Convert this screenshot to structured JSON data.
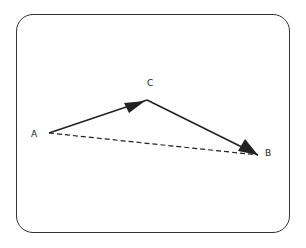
{
  "diagram": {
    "type": "vector-triangle",
    "points": {
      "A": {
        "label": "A",
        "x": 49,
        "y": 133
      },
      "C": {
        "label": "C",
        "x": 147,
        "y": 100
      },
      "B": {
        "label": "B",
        "x": 258,
        "y": 155
      }
    },
    "edges": [
      {
        "from": "A",
        "to": "C",
        "style": "solid",
        "arrow": "mid"
      },
      {
        "from": "C",
        "to": "B",
        "style": "solid",
        "arrow": "end"
      },
      {
        "from": "A",
        "to": "B",
        "style": "dashed",
        "arrow": "none"
      }
    ],
    "colors": {
      "stroke": "#222222",
      "frame": "#333333",
      "background": "#ffffff"
    }
  },
  "labels": {
    "a": "A",
    "b": "B",
    "c": "C"
  }
}
